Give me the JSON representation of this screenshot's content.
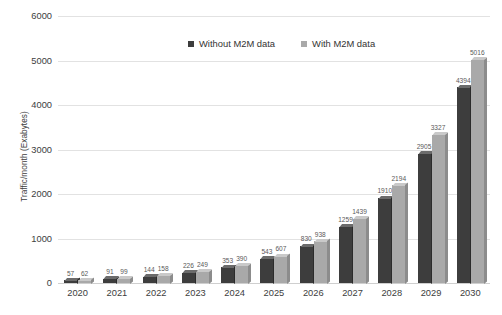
{
  "chart_data": {
    "type": "bar",
    "title": "",
    "subtitle": "",
    "xlabel": "",
    "ylabel": "Traffic/month (Exabytes)",
    "categories": [
      "2020",
      "2021",
      "2022",
      "2023",
      "2024",
      "2025",
      "2026",
      "2027",
      "2028",
      "2029",
      "2030"
    ],
    "series": [
      {
        "name": "Without M2M data",
        "color": "#3d3d3d",
        "values": [
          57,
          91,
          144,
          226,
          353,
          543,
          830,
          1259,
          1910,
          2905,
          4394
        ]
      },
      {
        "name": "With M2M data",
        "color": "#a9a9a9",
        "values": [
          62,
          99,
          158,
          249,
          390,
          607,
          938,
          1439,
          2194,
          3327,
          5016
        ]
      }
    ],
    "ylim": [
      0,
      6000
    ],
    "y_ticks": [
      0,
      1000,
      2000,
      3000,
      4000,
      5000,
      6000
    ],
    "y_tick_labels": [
      "0",
      "1000",
      "2000",
      "3000",
      "4000",
      "5000",
      "6000"
    ],
    "grid": true,
    "legend_position": "top-center",
    "data_labels": true
  },
  "colors": {
    "series_dark": "#3d3d3d",
    "series_light": "#a9a9a9",
    "gridline": "#e2e2e2",
    "text": "#3d3d3d",
    "background": "#ffffff"
  }
}
